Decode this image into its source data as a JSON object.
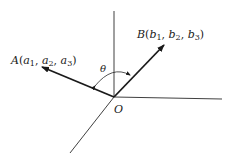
{
  "diagram": {
    "type": "vector-angle-3d",
    "origin": {
      "label": "O",
      "x": 114,
      "y": 97
    },
    "axes": [
      {
        "name": "z-axis",
        "from": [
          114,
          97
        ],
        "to": [
          114,
          11
        ]
      },
      {
        "name": "y-axis",
        "from": [
          114,
          97
        ],
        "to": [
          222,
          99
        ]
      },
      {
        "name": "x-axis",
        "from": [
          114,
          97
        ],
        "to": [
          70,
          153
        ]
      }
    ],
    "vectors": [
      {
        "name": "A",
        "label_letter": "A",
        "components": [
          "a",
          "a",
          "a"
        ],
        "subscripts": [
          "1",
          "2",
          "3"
        ],
        "tip": [
          41,
          67
        ]
      },
      {
        "name": "B",
        "label_letter": "B",
        "components": [
          "b",
          "b",
          "b"
        ],
        "subscripts": [
          "1",
          "2",
          "3"
        ],
        "tip": [
          165,
          44
        ]
      }
    ],
    "angle": {
      "label": "θ",
      "between": [
        "A",
        "B"
      ]
    },
    "colors": {
      "line": "#2a2a2a",
      "text": "#1a1a1a",
      "background": "#ffffff"
    }
  },
  "labels": {
    "origin": "O",
    "theta": "θ",
    "A": {
      "letter": "A",
      "open": "(",
      "c1": "a",
      "s1": "1",
      "c2": "a",
      "s2": "2",
      "c3": "a",
      "s3": "3",
      "close": ")",
      "sep": ", "
    },
    "B": {
      "letter": "B",
      "open": "(",
      "c1": "b",
      "s1": "1",
      "c2": "b",
      "s2": "2",
      "c3": "b",
      "s3": "3",
      "close": ")",
      "sep": ", "
    }
  }
}
